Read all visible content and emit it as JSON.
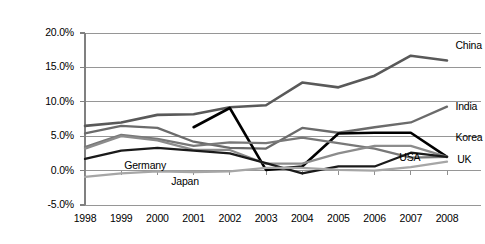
{
  "chart_data": {
    "type": "line",
    "title": "",
    "xlabel": "",
    "ylabel": "",
    "categories": [
      "1998",
      "1999",
      "2000",
      "2001",
      "2002",
      "2003",
      "2004",
      "2005",
      "2006",
      "2007",
      "2008"
    ],
    "x": [
      1998,
      1999,
      2000,
      2001,
      2002,
      2003,
      2004,
      2005,
      2006,
      2007,
      2008
    ],
    "ylim": [
      -5.0,
      20.0
    ],
    "xlim": [
      1998,
      2008
    ],
    "ytick_labels": [
      "20.0%",
      "15.0%",
      "10.0%",
      "5.0%",
      "0.0%",
      "-5.0%"
    ],
    "ytick_values": [
      20.0,
      15.0,
      10.0,
      5.0,
      0.0,
      -5.0
    ],
    "grid": "horizontal",
    "legend_position": "inline-right-labels",
    "series": [
      {
        "name": "China",
        "color": "#595959",
        "width": 2.6,
        "label_x": 2008.15,
        "label_y": 18.1,
        "values": [
          6.5,
          7.0,
          8.1,
          8.2,
          9.2,
          9.5,
          12.8,
          12.1,
          13.8,
          16.7,
          16.0
        ]
      },
      {
        "name": "India",
        "color": "#6b6b6b",
        "width": 2.3,
        "label_x": 2008.15,
        "label_y": 9.3,
        "values": [
          5.4,
          6.5,
          6.2,
          4.2,
          3.3,
          3.2,
          6.2,
          5.5,
          6.3,
          7.0,
          9.3
        ]
      },
      {
        "name": "Korea",
        "color": "#000000",
        "width": 2.6,
        "label_x": 2008.15,
        "label_y": 4.8,
        "values": [
          null,
          null,
          null,
          6.3,
          9.1,
          0.1,
          0.6,
          5.4,
          5.5,
          5.5,
          2.0
        ]
      },
      {
        "name": "USA",
        "color": "#787878",
        "width": 2.3,
        "label_x": 2006.6,
        "label_y": 1.9,
        "values": [
          3.4,
          5.2,
          4.6,
          3.6,
          4.1,
          4.0,
          4.8,
          4.0,
          3.2,
          1.9,
          2.0
        ]
      },
      {
        "name": "UK",
        "color": "#8c8c8c",
        "width": 2.3,
        "label_x": 2008.2,
        "label_y": 1.5,
        "values": [
          3.2,
          5.0,
          4.4,
          3.0,
          3.0,
          1.0,
          1.0,
          2.5,
          3.6,
          3.6,
          2.0
        ]
      },
      {
        "name": "Germany",
        "color": "#1a1a1a",
        "width": 2.3,
        "label_x": 1999.0,
        "label_y": 0.7,
        "values": [
          1.7,
          2.9,
          3.3,
          2.9,
          2.5,
          1.1,
          -0.4,
          0.6,
          0.6,
          2.6,
          2.0
        ]
      },
      {
        "name": "Japan",
        "color": "#a6a6a6",
        "width": 2.3,
        "label_x": 2000.3,
        "label_y": -1.6,
        "values": [
          -0.9,
          -0.4,
          -0.1,
          -0.2,
          -0.1,
          0.4,
          0.4,
          0.1,
          0.0,
          0.5,
          1.3
        ]
      }
    ]
  },
  "axis": {
    "gridline_color": "#969696",
    "axis_color": "#808080",
    "plot_background": "#ffffff"
  }
}
